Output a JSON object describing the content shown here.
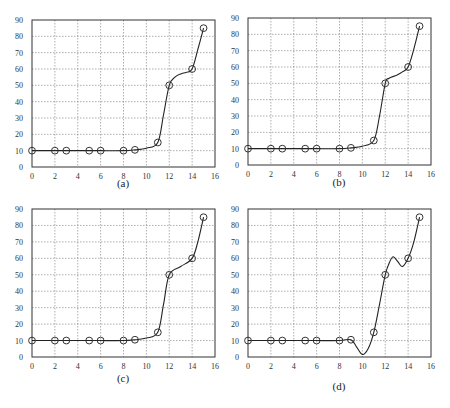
{
  "chart_data": [
    {
      "id": "a",
      "type": "line",
      "caption": "(a)",
      "title": "",
      "xlabel": "",
      "ylabel": "",
      "xlim": [
        0,
        16
      ],
      "ylim": [
        0,
        90
      ],
      "x_ticks": [
        0,
        2,
        4,
        6,
        8,
        10,
        12,
        14,
        16
      ],
      "y_ticks": [
        0,
        10,
        20,
        30,
        40,
        50,
        60,
        70,
        80,
        90
      ],
      "grid": true,
      "markers": "open-circle",
      "points": {
        "x": [
          0,
          2,
          3,
          5,
          6,
          8,
          9,
          11,
          12,
          14,
          15
        ],
        "y": [
          10,
          10,
          10,
          10,
          10,
          10,
          10.5,
          15,
          50,
          60,
          85
        ]
      },
      "curve": [
        [
          0,
          10
        ],
        [
          2,
          10
        ],
        [
          3,
          10
        ],
        [
          5,
          10
        ],
        [
          6,
          10
        ],
        [
          8,
          10
        ],
        [
          9,
          10.5
        ],
        [
          10,
          11.5
        ],
        [
          11,
          15
        ],
        [
          11.5,
          32
        ],
        [
          12,
          50
        ],
        [
          12.5,
          55
        ],
        [
          13,
          57
        ],
        [
          13.5,
          58
        ],
        [
          14,
          60
        ],
        [
          14.5,
          72
        ],
        [
          15,
          85
        ]
      ]
    },
    {
      "id": "b",
      "type": "line",
      "caption": "(b)",
      "title": "",
      "xlabel": "",
      "ylabel": "",
      "xlim": [
        0,
        16
      ],
      "ylim": [
        0,
        90
      ],
      "x_ticks": [
        0,
        2,
        4,
        6,
        8,
        10,
        12,
        14,
        16
      ],
      "y_ticks": [
        0,
        10,
        20,
        30,
        40,
        50,
        60,
        70,
        80,
        90
      ],
      "grid": true,
      "markers": "open-circle",
      "points": {
        "x": [
          0,
          2,
          3,
          5,
          6,
          8,
          9,
          11,
          12,
          14,
          15
        ],
        "y": [
          10,
          10,
          10,
          10,
          10,
          10,
          10.5,
          15,
          50,
          60,
          85
        ]
      },
      "curve": [
        [
          0,
          10
        ],
        [
          2,
          10
        ],
        [
          3,
          10
        ],
        [
          5,
          10
        ],
        [
          6,
          10
        ],
        [
          8,
          10
        ],
        [
          9,
          10.5
        ],
        [
          10,
          11.5
        ],
        [
          11,
          15
        ],
        [
          11.5,
          30
        ],
        [
          12,
          50
        ],
        [
          12.3,
          53
        ],
        [
          13,
          55
        ],
        [
          13.5,
          57
        ],
        [
          14,
          60
        ],
        [
          14.5,
          71
        ],
        [
          15,
          85
        ]
      ]
    },
    {
      "id": "c",
      "type": "line",
      "caption": "(c)",
      "title": "",
      "xlabel": "",
      "ylabel": "",
      "xlim": [
        0,
        16
      ],
      "ylim": [
        0,
        90
      ],
      "x_ticks": [
        0,
        2,
        4,
        6,
        8,
        10,
        12,
        14,
        16
      ],
      "y_ticks": [
        0,
        10,
        20,
        30,
        40,
        50,
        60,
        70,
        80,
        90
      ],
      "grid": true,
      "markers": "open-circle",
      "points": {
        "x": [
          0,
          2,
          3,
          5,
          6,
          8,
          9,
          11,
          12,
          14,
          15
        ],
        "y": [
          10,
          10,
          10,
          10,
          10,
          10,
          10.5,
          15,
          50,
          60,
          85
        ]
      },
      "curve": [
        [
          0,
          10
        ],
        [
          2,
          10
        ],
        [
          3,
          10
        ],
        [
          5,
          10
        ],
        [
          6,
          10
        ],
        [
          8,
          10
        ],
        [
          9,
          10.5
        ],
        [
          10,
          11.5
        ],
        [
          11,
          15
        ],
        [
          11.5,
          32
        ],
        [
          12,
          50
        ],
        [
          13,
          55
        ],
        [
          14,
          60
        ],
        [
          14.5,
          70
        ],
        [
          15,
          85
        ]
      ]
    },
    {
      "id": "d",
      "type": "line",
      "caption": "(d)",
      "title": "",
      "xlabel": "",
      "ylabel": "",
      "xlim": [
        0,
        16
      ],
      "ylim": [
        0,
        90
      ],
      "x_ticks": [
        0,
        2,
        4,
        6,
        8,
        10,
        12,
        14,
        16
      ],
      "y_ticks": [
        0,
        10,
        20,
        30,
        40,
        50,
        60,
        70,
        80,
        90
      ],
      "grid": true,
      "markers": "open-circle",
      "points": {
        "x": [
          0,
          2,
          3,
          5,
          6,
          8,
          9,
          11,
          12,
          14,
          15
        ],
        "y": [
          10,
          10,
          10,
          10,
          10,
          10,
          10.5,
          15,
          50,
          60,
          85
        ]
      },
      "curve": [
        [
          0,
          10
        ],
        [
          2,
          10
        ],
        [
          3,
          10
        ],
        [
          5,
          10
        ],
        [
          6,
          10
        ],
        [
          8,
          10
        ],
        [
          9,
          10.5
        ],
        [
          9.5,
          6
        ],
        [
          10,
          1.5
        ],
        [
          10.5,
          5
        ],
        [
          11,
          15
        ],
        [
          11.5,
          32
        ],
        [
          12,
          50
        ],
        [
          12.4,
          58
        ],
        [
          12.7,
          61
        ],
        [
          13.1,
          58
        ],
        [
          13.5,
          55
        ],
        [
          14,
          60
        ],
        [
          14.5,
          70
        ],
        [
          15,
          85
        ]
      ]
    }
  ]
}
